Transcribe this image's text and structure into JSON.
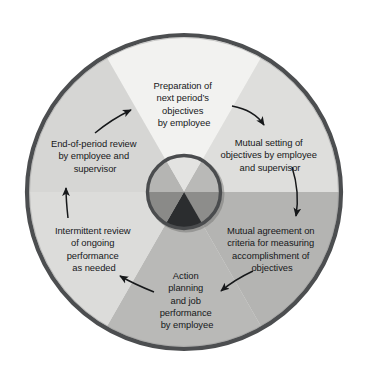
{
  "diagram": {
    "type": "cycle-wheel",
    "segment_count": 6,
    "rotation_direction": "clockwise",
    "outer_ring_color": "#4c4e50",
    "hub_ring_color": "#4a4c4e",
    "arrow_color": "#1a1c1e",
    "background_color": "#ffffff",
    "geometry": {
      "center_x": 184,
      "center_y": 192,
      "outer_radius": 159,
      "hub_radius": 40,
      "wedge_boundaries_deg": [
        0,
        60,
        120,
        180,
        240,
        300
      ]
    },
    "segments": [
      {
        "id": "preparation",
        "position": "top",
        "angle_start_deg": 240,
        "angle_end_deg": 300,
        "fill": "#f2f2f0",
        "hub_fill": "#e3e3e1",
        "lines": [
          "Preparation of",
          "next period’s",
          "objectives",
          "by employee"
        ]
      },
      {
        "id": "mutual-setting",
        "position": "upper-right",
        "angle_start_deg": 300,
        "angle_end_deg": 360,
        "fill": "#dededc",
        "hub_fill": "#b9b9b7",
        "lines": [
          "Mutual setting of",
          "objectives by employee",
          "and supervisor"
        ]
      },
      {
        "id": "mutual-agreement",
        "position": "lower-right",
        "angle_start_deg": 0,
        "angle_end_deg": 60,
        "fill": "#b4b4b2",
        "hub_fill": "#8d8d8b",
        "lines": [
          "Mutual agreement on",
          "criteria for measuring",
          "accomplishment of",
          "objectives"
        ]
      },
      {
        "id": "action-planning",
        "position": "bottom",
        "angle_start_deg": 60,
        "angle_end_deg": 120,
        "fill": "#b9b9b7",
        "hub_fill": "#2b2d2f",
        "lines": [
          "Action",
          "planning",
          "and job",
          "performance",
          "by employee"
        ]
      },
      {
        "id": "intermittent-review",
        "position": "lower-left",
        "angle_start_deg": 120,
        "angle_end_deg": 180,
        "fill": "#dcdcda",
        "hub_fill": "#8a8a88",
        "lines": [
          "Intermittent review",
          "of ongoing",
          "performance",
          "as needed"
        ]
      },
      {
        "id": "end-of-period-review",
        "position": "upper-left",
        "angle_start_deg": 180,
        "angle_end_deg": 240,
        "fill": "#d6d6d4",
        "hub_fill": "#b5b5b3",
        "lines": [
          "End-of-period review",
          "by employee and",
          "supervisor"
        ]
      }
    ],
    "arrows": [
      {
        "id": "arrow-top-to-upper-right",
        "from": "preparation",
        "to": "mutual-setting",
        "style": "curved"
      },
      {
        "id": "arrow-upper-right-to-lower-right",
        "from": "mutual-setting",
        "to": "mutual-agreement",
        "style": "curved"
      },
      {
        "id": "arrow-lower-right-to-bottom",
        "from": "mutual-agreement",
        "to": "action-planning",
        "style": "curved"
      },
      {
        "id": "arrow-bottom-to-lower-left",
        "from": "action-planning",
        "to": "intermittent-review",
        "style": "curved"
      },
      {
        "id": "arrow-lower-left-to-upper-left",
        "from": "intermittent-review",
        "to": "end-of-period-review",
        "style": "straight"
      },
      {
        "id": "arrow-upper-left-to-top",
        "from": "end-of-period-review",
        "to": "preparation",
        "style": "curved"
      }
    ]
  }
}
